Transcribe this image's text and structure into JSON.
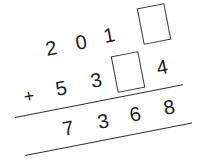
{
  "problem": {
    "type": "column-addition",
    "rotation_deg": -11,
    "addend1": {
      "digits": [
        "2",
        "0",
        "1",
        "□"
      ],
      "missing_index": 3
    },
    "addend2": {
      "operator": "+",
      "digits": [
        "5",
        "3",
        "□",
        "4"
      ],
      "missing_index": 2
    },
    "sum": {
      "digits": [
        "7",
        "3",
        "6",
        "8"
      ]
    }
  },
  "labels": {
    "plus": "+",
    "a1_d1": "2",
    "a1_d2": "0",
    "a1_d3": "1",
    "a2_d1": "5",
    "a2_d2": "3",
    "a2_d4": "4",
    "s_d1": "7",
    "s_d2": "3",
    "s_d3": "6",
    "s_d4": "8"
  },
  "colors": {
    "ink": "#222222",
    "background": "#ffffff"
  }
}
